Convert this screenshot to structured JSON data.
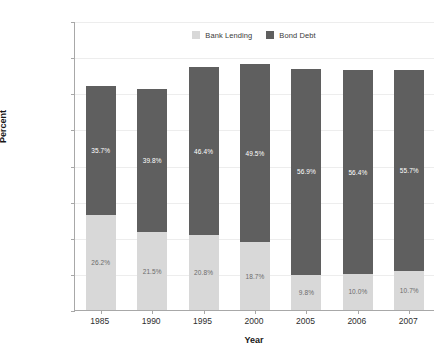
{
  "chart_data": {
    "type": "bar",
    "subtype": "stacked-bar",
    "title": "",
    "xlabel": "Year",
    "ylabel": "Percent",
    "categories": [
      "1985",
      "1990",
      "1995",
      "2000",
      "2005",
      "2006",
      "2007"
    ],
    "series": [
      {
        "name": "Bank Lending",
        "color": "#d8d8d8",
        "values": [
          26.2,
          21.5,
          20.8,
          18.7,
          9.8,
          10.0,
          10.7
        ],
        "labels": [
          "26.2%",
          "21.5%",
          "20.8%",
          "18.7%",
          "9.8%",
          "10.0%",
          "10.7%"
        ]
      },
      {
        "name": "Bond Debt",
        "color": "#5f5f5f",
        "values": [
          35.7,
          39.8,
          46.4,
          49.5,
          56.9,
          56.4,
          55.7
        ],
        "labels": [
          "35.7%",
          "39.8%",
          "46.4%",
          "49.5%",
          "56.9%",
          "56.4%",
          "55.7%"
        ]
      }
    ],
    "totals": [
      61.9,
      61.3,
      67.2,
      68.2,
      66.7,
      66.4,
      66.4
    ],
    "ylim": [
      0,
      80
    ],
    "yticks": [
      0,
      10,
      20,
      30,
      40,
      50,
      60,
      70,
      80
    ],
    "ytick_labels": [
      "0.0%",
      "10.0%",
      "20.0%",
      "30.0%",
      "40.0%",
      "50.0%",
      "60.0%",
      "70.0%",
      "80.0%"
    ],
    "grid": true,
    "legend_position": "top-center",
    "legend_entries": [
      "Bank Lending",
      "Bond Debt"
    ],
    "axis_color": "#a8a8a8",
    "grid_color": "#ededed",
    "background": "#ffffff"
  }
}
